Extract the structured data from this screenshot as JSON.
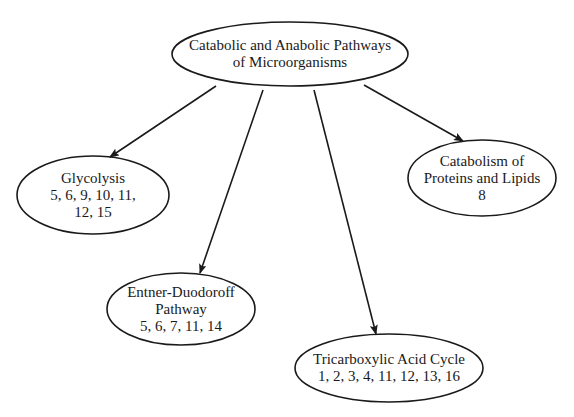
{
  "diagram": {
    "colors": {
      "stroke": "#1a1a1a",
      "text": "#1a1a1a",
      "background": "#ffffff"
    },
    "root": {
      "lines": [
        "Catabolic and Anabolic Pathways",
        "of Microorganisms"
      ],
      "cx": 290,
      "cy": 54,
      "rx": 118,
      "ry": 32
    },
    "nodes": [
      {
        "id": "glycolysis",
        "lines": [
          "Glycolysis",
          "5, 6, 9, 10, 11,",
          "12, 15"
        ],
        "cx": 93,
        "cy": 195,
        "rx": 76,
        "ry": 39
      },
      {
        "id": "entner-duodoroff",
        "lines": [
          "Entner-Duodoroff",
          "Pathway",
          "5, 6, 7, 11, 14"
        ],
        "cx": 181,
        "cy": 309,
        "rx": 74,
        "ry": 36
      },
      {
        "id": "tricarboxylic-acid-cycle",
        "lines": [
          "Tricarboxylic Acid Cycle",
          "1, 2, 3, 4, 11, 12, 13, 16"
        ],
        "cx": 389,
        "cy": 368,
        "rx": 94,
        "ry": 34
      },
      {
        "id": "catabolism-proteins-lipids",
        "lines": [
          "Catabolism of",
          "Proteins and Lipids",
          "8"
        ],
        "cx": 482,
        "cy": 178,
        "rx": 74,
        "ry": 38
      }
    ],
    "edges": [
      {
        "from": "root",
        "to": "glycolysis",
        "x1": 216,
        "y1": 86,
        "x2": 110,
        "y2": 157
      },
      {
        "from": "root",
        "to": "entner-duodoroff",
        "x1": 263,
        "y1": 90,
        "x2": 200,
        "y2": 273
      },
      {
        "from": "root",
        "to": "tricarboxylic-acid-cycle",
        "x1": 314,
        "y1": 90,
        "x2": 376,
        "y2": 334
      },
      {
        "from": "root",
        "to": "catabolism-proteins-lipids",
        "x1": 364,
        "y1": 85,
        "x2": 463,
        "y2": 141
      }
    ]
  }
}
